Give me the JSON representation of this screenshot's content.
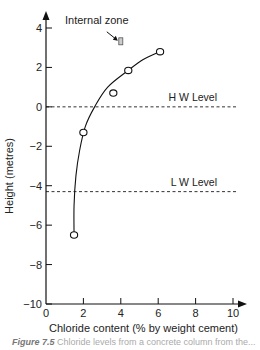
{
  "chart_data": {
    "type": "scatter",
    "title": "",
    "xlabel": "Chloride content (% by weight cement)",
    "ylabel": "Height (metres)",
    "xlim": [
      0,
      10
    ],
    "ylim": [
      -10,
      4
    ],
    "x_ticks": [
      0,
      2,
      4,
      6,
      8,
      10
    ],
    "y_ticks": [
      4,
      2,
      0,
      -2,
      -4,
      -6,
      -8,
      -10
    ],
    "x_tick_labels": [
      "0",
      "2",
      "4",
      "6",
      "8",
      "10"
    ],
    "y_tick_labels": [
      "4",
      "2",
      "0",
      "−2",
      "−4",
      "−6",
      "−8",
      "−10"
    ],
    "grid": false,
    "series": [
      {
        "name": "Measured chloride (external)",
        "marker": "open-circle",
        "points": [
          {
            "x": 1.5,
            "y": -6.5
          },
          {
            "x": 2.0,
            "y": -1.3
          },
          {
            "x": 3.6,
            "y": 0.7
          },
          {
            "x": 4.4,
            "y": 1.85
          },
          {
            "x": 6.1,
            "y": 2.8
          }
        ]
      },
      {
        "name": "Internal zone",
        "marker": "small-rectangle",
        "points": [
          {
            "x": 4.0,
            "y": 3.3
          }
        ]
      }
    ],
    "trend_curve": [
      {
        "x": 1.5,
        "y": -6.5
      },
      {
        "x": 1.5,
        "y": -5.0
      },
      {
        "x": 1.6,
        "y": -3.5
      },
      {
        "x": 1.8,
        "y": -2.2
      },
      {
        "x": 2.1,
        "y": -1.0
      },
      {
        "x": 2.6,
        "y": 0.0
      },
      {
        "x": 3.3,
        "y": 1.0
      },
      {
        "x": 4.4,
        "y": 1.85
      },
      {
        "x": 5.2,
        "y": 2.4
      },
      {
        "x": 6.1,
        "y": 2.8
      }
    ],
    "reference_lines": [
      {
        "label": "H W Level",
        "y": 0,
        "style": "dashed"
      },
      {
        "label": "L W Level",
        "y": -4.3,
        "style": "dashed"
      }
    ],
    "annotations": [
      {
        "text": "Internal zone",
        "arrow_to": {
          "x": 4.0,
          "y": 3.3
        }
      }
    ]
  },
  "caption": {
    "label": "Figure 7.5",
    "text": "Chloride levels from a concrete column from the..."
  }
}
